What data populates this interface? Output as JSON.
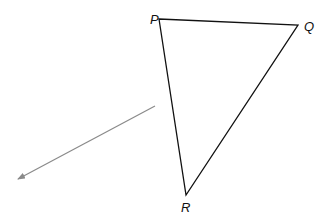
{
  "diagram": {
    "type": "triangle-with-vector",
    "vertices": [
      {
        "name": "P",
        "x": 159,
        "y": 19,
        "label_x": 150,
        "label_y": 24
      },
      {
        "name": "Q",
        "x": 298,
        "y": 25,
        "label_x": 304,
        "label_y": 31
      },
      {
        "name": "R",
        "x": 186,
        "y": 195,
        "label_x": 181,
        "label_y": 212
      }
    ],
    "arrow": {
      "from": [
        155,
        106
      ],
      "to": [
        18,
        179
      ],
      "color": "#8a8a8a"
    },
    "colors": {
      "triangle": "#111111",
      "labels": "#111111"
    }
  }
}
